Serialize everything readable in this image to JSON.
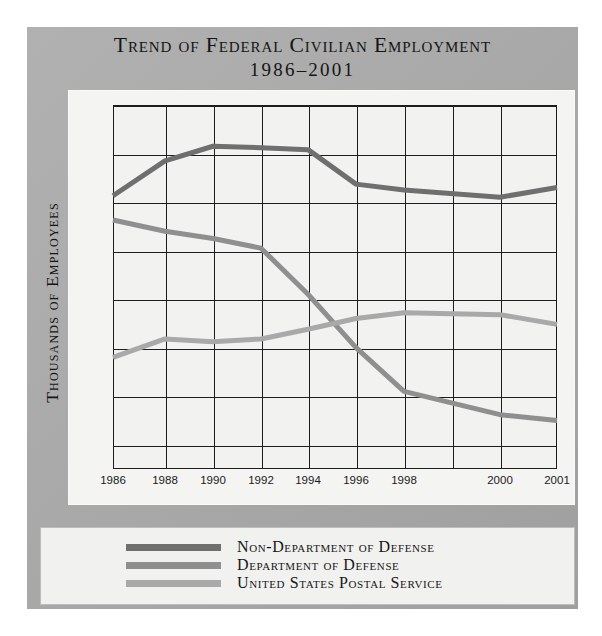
{
  "figure": {
    "title_line1": "Trend of Federal Civilian Employment",
    "title_line2": "1986–2001",
    "ylabel": "Thousands of Employees"
  },
  "legend": {
    "items": [
      {
        "label": "Non-Department of Defense",
        "color": "#6f6f6f"
      },
      {
        "label": "Department of Defense",
        "color": "#8f8f8f"
      },
      {
        "label": "United States Postal Service",
        "color": "#a9a9a9"
      }
    ]
  },
  "colors": {
    "plate": "#a8a8a8",
    "card": "#f4f4f2",
    "axis": "#1d1d1d",
    "non_dod": "#6f6f6f",
    "dod": "#8f8f8f",
    "usps": "#a9a9a9"
  },
  "chart_data": {
    "type": "line",
    "xlabel": "",
    "ylabel": "Thousands of Employees",
    "xlim": [
      1986,
      2001
    ],
    "ylim": [
      550,
      1300
    ],
    "ytick_labels": [
      "1,300",
      "1,200",
      "1,100",
      "1000",
      "900",
      "800",
      "700",
      "600"
    ],
    "ytick_values": [
      1300,
      1200,
      1100,
      1000,
      900,
      800,
      700,
      600
    ],
    "xtick_labels": [
      "1986",
      "1988",
      "1990",
      "1992",
      "1994",
      "1996",
      "1998",
      "2000",
      "2001"
    ],
    "xtick_values": [
      1986,
      1988,
      1990,
      1992,
      1994,
      1996,
      1998,
      2000,
      2001
    ],
    "grid": true,
    "legend_position": "bottom",
    "x": [
      1986,
      1988,
      1990,
      1992,
      1994,
      1996,
      1998,
      2000,
      2001
    ],
    "series": [
      {
        "name": "Non-Department of Defense",
        "color": "#6f6f6f",
        "values": [
          1113,
          1185,
          1215,
          1212,
          1208,
          1137,
          1125,
          1110,
          1130
        ]
      },
      {
        "name": "Department of Defense",
        "color": "#8f8f8f",
        "values": [
          1063,
          1040,
          1025,
          1005,
          910,
          800,
          710,
          662,
          650
        ]
      },
      {
        "name": "United States Postal Service",
        "color": "#a9a9a9",
        "values": [
          780,
          818,
          812,
          818,
          838,
          860,
          872,
          868,
          848
        ]
      }
    ]
  }
}
